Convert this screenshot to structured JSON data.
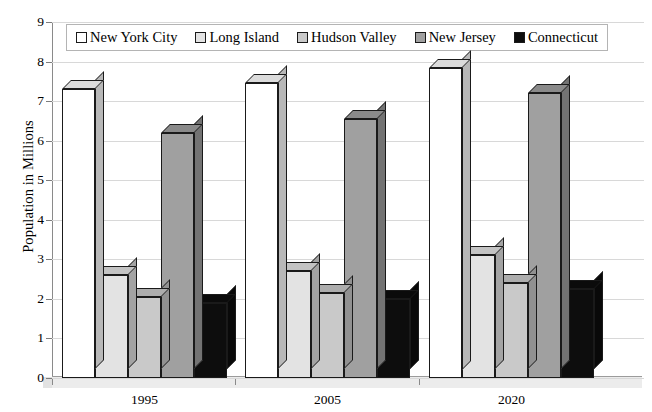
{
  "chart_data": {
    "type": "bar",
    "title": "",
    "xlabel": "",
    "ylabel": "Population in Millions",
    "categories": [
      "1995",
      "2005",
      "2020"
    ],
    "ylim": [
      0,
      9
    ],
    "yticks": [
      0,
      1,
      2,
      3,
      4,
      5,
      6,
      7,
      8,
      9
    ],
    "grid": true,
    "legend_position": "top",
    "series": [
      {
        "name": "New York City",
        "color": "#ffffff",
        "values": [
          7.3,
          7.45,
          7.85
        ]
      },
      {
        "name": "Long Island",
        "color": "#e3e3e3",
        "values": [
          2.6,
          2.7,
          3.1
        ]
      },
      {
        "name": "Hudson Valley",
        "color": "#c9c9c9",
        "values": [
          2.05,
          2.15,
          2.4
        ]
      },
      {
        "name": "New Jersey",
        "color": "#a0a0a0",
        "values": [
          6.2,
          6.55,
          7.2
        ]
      },
      {
        "name": "Connecticut",
        "color": "#0d0d0d",
        "values": [
          1.9,
          2.0,
          2.25
        ]
      }
    ]
  },
  "axis": {
    "y_title": "Population in Millions",
    "y_tick_labels": [
      "9",
      "8",
      "7",
      "6",
      "5",
      "4",
      "3",
      "2",
      "1",
      "0"
    ],
    "x_tick_labels": [
      "1995",
      "2005",
      "2020"
    ]
  },
  "legend": {
    "items": [
      {
        "label": "New York City",
        "swatch": "#ffffff"
      },
      {
        "label": "Long Island",
        "swatch": "#e3e3e3"
      },
      {
        "label": "Hudson Valley",
        "swatch": "#c9c9c9"
      },
      {
        "label": "New Jersey",
        "swatch": "#a0a0a0"
      },
      {
        "label": "Connecticut",
        "swatch": "#0d0d0d"
      }
    ]
  }
}
